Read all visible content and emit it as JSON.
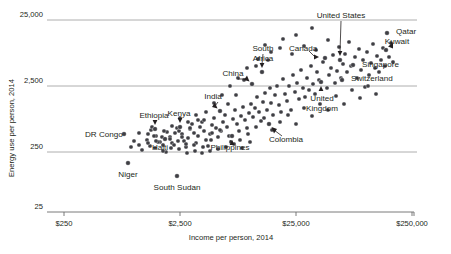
{
  "chart_data": {
    "type": "scatter",
    "title": "",
    "xlabel": "Income per person, 2014",
    "ylabel": "Energy use per person, 2014",
    "xscale": "log",
    "yscale": "log",
    "xlim": [
      175,
      360000
    ],
    "ylim": [
      18,
      40000
    ],
    "grid": true,
    "legend": "none",
    "x_ticks": [
      {
        "value": 250,
        "label": "$250"
      },
      {
        "value": 2500,
        "label": "$2,500"
      },
      {
        "value": 25000,
        "label": "$25,000"
      },
      {
        "value": 250000,
        "label": "$250,000"
      }
    ],
    "y_ticks": [
      {
        "value": 25000,
        "label": "25,000"
      },
      {
        "value": 2500,
        "label": "2,500"
      },
      {
        "value": 250,
        "label": "250"
      },
      {
        "value": 25,
        "label": "25"
      }
    ],
    "annotations": [
      {
        "label": "United States",
        "px": 340,
        "py": 60,
        "lx": 341,
        "ly": 18,
        "leader": "down"
      },
      {
        "label": "Qatar",
        "px": 387,
        "py": 33,
        "lx": 396,
        "ly": 34,
        "leader": "none"
      },
      {
        "label": "Kuwait",
        "px": 386,
        "py": 50,
        "lx": 397,
        "ly": 44,
        "leader": "short-up-left"
      },
      {
        "label": "Singapore",
        "px": 353,
        "py": 65,
        "lx": 362,
        "ly": 67,
        "leader": "none"
      },
      {
        "label": "Switzerland",
        "px": 342,
        "py": 80,
        "lx": 351,
        "ly": 81,
        "leader": "none"
      },
      {
        "label": "Canada",
        "px": 325,
        "py": 58,
        "lx": 289,
        "ly": 51,
        "leader": "right-arrow"
      },
      {
        "label": "South Africa",
        "px": 262,
        "py": 72,
        "lx": 263,
        "ly": 51,
        "leader": "down"
      },
      {
        "label": "China",
        "px": 252,
        "py": 84,
        "lx": 233,
        "ly": 76,
        "leader": "diag-down-right"
      },
      {
        "label": "United Kingdom",
        "px": 321,
        "py": 82,
        "lx": 322,
        "ly": 101,
        "leader": "up"
      },
      {
        "label": "India",
        "px": 220,
        "py": 111,
        "lx": 213,
        "ly": 99,
        "leader": "diag-down-right"
      },
      {
        "label": "Kenya",
        "px": 180,
        "py": 127,
        "lx": 179,
        "ly": 116,
        "leader": "down"
      },
      {
        "label": "Ethiopia",
        "px": 155,
        "py": 129,
        "lx": 154,
        "ly": 118,
        "leader": "down"
      },
      {
        "label": "DR Congo",
        "px": 124,
        "py": 134,
        "lx": 85,
        "ly": 137,
        "leader": "none"
      },
      {
        "label": "Haiti",
        "px": 165,
        "py": 139,
        "lx": 160,
        "ly": 150,
        "leader": "none"
      },
      {
        "label": "Philippines",
        "px": 232,
        "py": 136,
        "lx": 230,
        "ly": 150,
        "leader": "up"
      },
      {
        "label": "Colombia",
        "px": 269,
        "py": 124,
        "lx": 286,
        "ly": 142,
        "leader": "diag-up-left"
      },
      {
        "label": "Niger",
        "px": 128,
        "py": 163,
        "lx": 128,
        "ly": 177,
        "leader": "none"
      },
      {
        "label": "South Sudan",
        "px": 177,
        "py": 176,
        "lx": 177,
        "ly": 190,
        "leader": "none"
      }
    ],
    "points": [
      [
        124,
        134
      ],
      [
        128,
        163
      ],
      [
        177,
        176
      ],
      [
        139,
        133
      ],
      [
        148,
        134
      ],
      [
        151,
        130
      ],
      [
        152,
        127
      ],
      [
        155,
        129
      ],
      [
        156,
        136
      ],
      [
        160,
        142
      ],
      [
        163,
        145
      ],
      [
        165,
        139
      ],
      [
        167,
        132
      ],
      [
        170,
        137
      ],
      [
        172,
        143
      ],
      [
        175,
        133
      ],
      [
        177,
        128
      ],
      [
        179,
        131
      ],
      [
        180,
        127
      ],
      [
        182,
        134
      ],
      [
        184,
        141
      ],
      [
        186,
        147
      ],
      [
        188,
        138
      ],
      [
        190,
        129
      ],
      [
        192,
        124
      ],
      [
        194,
        133
      ],
      [
        196,
        143
      ],
      [
        198,
        136
      ],
      [
        200,
        127
      ],
      [
        202,
        122
      ],
      [
        204,
        131
      ],
      [
        206,
        140
      ],
      [
        208,
        146
      ],
      [
        210,
        134
      ],
      [
        212,
        125
      ],
      [
        214,
        118
      ],
      [
        216,
        128
      ],
      [
        218,
        137
      ],
      [
        220,
        111
      ],
      [
        221,
        131
      ],
      [
        223,
        122
      ],
      [
        225,
        115
      ],
      [
        227,
        127
      ],
      [
        229,
        136
      ],
      [
        231,
        142
      ],
      [
        232,
        136
      ],
      [
        233,
        119
      ],
      [
        235,
        110
      ],
      [
        237,
        124
      ],
      [
        239,
        131
      ],
      [
        241,
        116
      ],
      [
        243,
        107
      ],
      [
        245,
        120
      ],
      [
        247,
        128
      ],
      [
        249,
        113
      ],
      [
        251,
        104
      ],
      [
        252,
        84
      ],
      [
        253,
        117
      ],
      [
        255,
        108
      ],
      [
        257,
        97
      ],
      [
        259,
        112
      ],
      [
        261,
        121
      ],
      [
        262,
        72
      ],
      [
        263,
        102
      ],
      [
        265,
        93
      ],
      [
        267,
        110
      ],
      [
        269,
        124
      ],
      [
        270,
        88
      ],
      [
        271,
        103
      ],
      [
        273,
        115
      ],
      [
        275,
        95
      ],
      [
        277,
        86
      ],
      [
        279,
        105
      ],
      [
        281,
        112
      ],
      [
        283,
        79
      ],
      [
        285,
        94
      ],
      [
        287,
        101
      ],
      [
        289,
        86
      ],
      [
        291,
        110
      ],
      [
        293,
        75
      ],
      [
        295,
        92
      ],
      [
        297,
        83
      ],
      [
        299,
        99
      ],
      [
        301,
        70
      ],
      [
        303,
        88
      ],
      [
        305,
        97
      ],
      [
        307,
        78
      ],
      [
        309,
        90
      ],
      [
        311,
        66
      ],
      [
        313,
        84
      ],
      [
        315,
        94
      ],
      [
        317,
        72
      ],
      [
        319,
        80
      ],
      [
        321,
        82
      ],
      [
        323,
        62
      ],
      [
        325,
        58
      ],
      [
        327,
        88
      ],
      [
        329,
        75
      ],
      [
        331,
        68
      ],
      [
        333,
        55
      ],
      [
        335,
        83
      ],
      [
        337,
        71
      ],
      [
        339,
        47
      ],
      [
        340,
        60
      ],
      [
        341,
        78
      ],
      [
        343,
        64
      ],
      [
        342,
        80
      ],
      [
        345,
        54
      ],
      [
        347,
        72
      ],
      [
        349,
        42
      ],
      [
        351,
        66
      ],
      [
        353,
        65
      ],
      [
        355,
        57
      ],
      [
        357,
        78
      ],
      [
        359,
        49
      ],
      [
        361,
        70
      ],
      [
        363,
        60
      ],
      [
        365,
        87
      ],
      [
        367,
        52
      ],
      [
        369,
        75
      ],
      [
        371,
        63
      ],
      [
        373,
        44
      ],
      [
        375,
        68
      ],
      [
        377,
        56
      ],
      [
        379,
        72
      ],
      [
        381,
        60
      ],
      [
        383,
        48
      ],
      [
        385,
        66
      ],
      [
        386,
        50
      ],
      [
        387,
        33
      ],
      [
        389,
        57
      ],
      [
        391,
        43
      ],
      [
        393,
        62
      ],
      [
        283,
        39
      ],
      [
        296,
        35
      ],
      [
        312,
        28
      ],
      [
        265,
        45
      ],
      [
        271,
        52
      ],
      [
        258,
        59
      ],
      [
        247,
        68
      ],
      [
        238,
        78
      ],
      [
        230,
        86
      ],
      [
        222,
        95
      ],
      [
        214,
        103
      ],
      [
        206,
        112
      ],
      [
        198,
        120
      ],
      [
        190,
        128
      ],
      [
        182,
        137
      ],
      [
        174,
        145
      ],
      [
        166,
        152
      ],
      [
        158,
        142
      ],
      [
        150,
        146
      ],
      [
        142,
        150
      ],
      [
        134,
        141
      ],
      [
        256,
        66
      ],
      [
        244,
        80
      ],
      [
        268,
        60
      ],
      [
        280,
        48
      ],
      [
        292,
        54
      ],
      [
        304,
        46
      ],
      [
        316,
        50
      ],
      [
        328,
        40
      ],
      [
        211,
        140
      ],
      [
        203,
        147
      ],
      [
        195,
        151
      ],
      [
        187,
        153
      ],
      [
        179,
        149
      ],
      [
        171,
        148
      ],
      [
        163,
        151
      ],
      [
        155,
        148
      ],
      [
        147,
        140
      ],
      [
        139,
        145
      ],
      [
        131,
        147
      ],
      [
        236,
        95
      ],
      [
        228,
        104
      ],
      [
        220,
        130
      ],
      [
        212,
        133
      ],
      [
        204,
        120
      ],
      [
        196,
        115
      ],
      [
        188,
        122
      ],
      [
        180,
        118
      ],
      [
        172,
        126
      ],
      [
        164,
        131
      ],
      [
        156,
        141
      ],
      [
        148,
        143
      ],
      [
        240,
        140
      ],
      [
        248,
        134
      ],
      [
        256,
        127
      ],
      [
        264,
        118
      ],
      [
        272,
        130
      ],
      [
        280,
        122
      ],
      [
        288,
        115
      ],
      [
        296,
        124
      ],
      [
        304,
        108
      ],
      [
        312,
        116
      ],
      [
        320,
        104
      ],
      [
        328,
        110
      ],
      [
        336,
        96
      ],
      [
        344,
        104
      ],
      [
        352,
        90
      ],
      [
        360,
        98
      ],
      [
        368,
        86
      ],
      [
        376,
        94
      ],
      [
        250,
        142
      ],
      [
        242,
        148
      ],
      [
        234,
        144
      ],
      [
        226,
        147
      ],
      [
        218,
        149
      ],
      [
        210,
        151
      ],
      [
        202,
        153
      ],
      [
        194,
        145
      ],
      [
        186,
        144
      ],
      [
        178,
        141
      ],
      [
        170,
        139
      ],
      [
        162,
        137
      ],
      [
        154,
        136
      ]
    ]
  }
}
